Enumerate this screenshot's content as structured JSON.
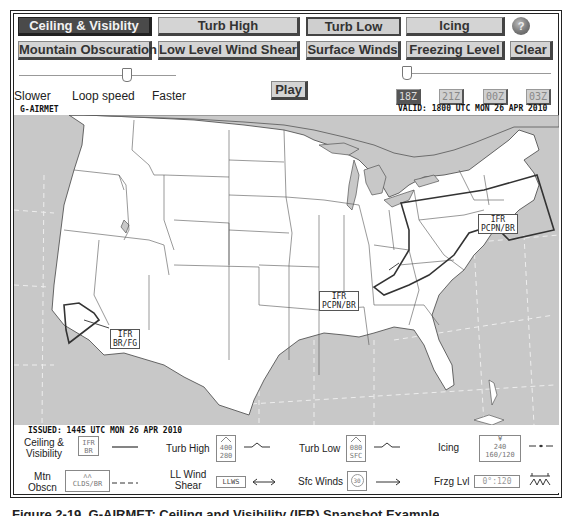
{
  "product_buttons": {
    "row1": [
      {
        "label": "Ceiling & Visiblity",
        "active": true
      },
      {
        "label": "Turb High",
        "active": false
      },
      {
        "label": "Turb Low",
        "active": false
      },
      {
        "label": "Icing",
        "active": false
      }
    ],
    "row2": [
      {
        "label": "Mountain Obscuration"
      },
      {
        "label": "Low Level Wind Shear"
      },
      {
        "label": "Surface Winds"
      },
      {
        "label": "Freezing Level"
      }
    ],
    "help_label": "?",
    "clear_label": "Clear"
  },
  "loop_controls": {
    "slower_label": "Slower",
    "speed_label": "Loop speed",
    "faster_label": "Faster",
    "play_label": "Play"
  },
  "time_steps": [
    {
      "label": "18Z",
      "active": true
    },
    {
      "label": "21Z",
      "active": false
    },
    {
      "label": "00Z",
      "active": false
    },
    {
      "label": "03Z",
      "active": false
    }
  ],
  "map": {
    "product_title": "G-AIRMET",
    "valid_text": "VALID: 1800 UTC MON 26 APR 2010",
    "issued_text": "ISSUED: 1445 UTC MON 26 APR 2010",
    "areas": [
      {
        "line1": "IFR",
        "line2": "PCPN/BR",
        "region": "northeast"
      },
      {
        "line1": "IFR",
        "line2": "PCPN/BR",
        "region": "south-central"
      },
      {
        "line1": "IFR",
        "line2": "BR/FG",
        "region": "southern-california"
      }
    ]
  },
  "legend": {
    "ceiling_visibility": {
      "label_line1": "Ceiling &",
      "label_line2": "Visibility",
      "box_line1": "IFR",
      "box_line2": "BR"
    },
    "turb_high": {
      "label": "Turb High",
      "box_line1": "400",
      "box_line2": "280"
    },
    "turb_low": {
      "label": "Turb Low",
      "box_line1": "080",
      "box_line2": "SFC"
    },
    "icing": {
      "label": "Icing",
      "box_line1": "240",
      "box_line2": "160/120"
    },
    "mtn_obscn": {
      "label_line1": "Mtn",
      "label_line2": "Obscn",
      "box_text": "CLDS/BR"
    },
    "ll_wind_shear": {
      "label_line1": "LL Wind",
      "label_line2": "Shear",
      "box_text": "LLWS"
    },
    "sfc_winds": {
      "label": "Sfc  Winds",
      "box_text": "30"
    },
    "frzg_lvl": {
      "label": "Frzg Lvl",
      "box_text": "0°:120"
    }
  },
  "caption": "Figure 2-19. G-AIRMET: Ceiling and Visibility (IFR) Snapshot Example"
}
